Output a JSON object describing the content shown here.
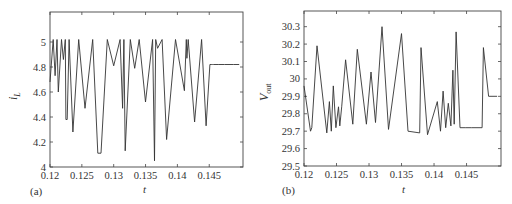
{
  "chart_data": [
    {
      "type": "line",
      "panel": "(a)",
      "title": "",
      "xlabel": "t",
      "ylabel": "i_L",
      "xlim": [
        0.12,
        0.1503
      ],
      "ylim": [
        4,
        5.24
      ],
      "xticks": [
        0.12,
        0.125,
        0.13,
        0.135,
        0.14,
        0.145
      ],
      "xtick_labels": [
        "0.12",
        "0.125",
        "0.13",
        "0.135",
        "0.14",
        "0.145"
      ],
      "yticks": [
        4,
        4.2,
        4.4,
        4.6,
        4.8,
        5
      ],
      "ytick_labels": [
        "4",
        "4.2",
        "4.4",
        "4.6",
        "4.8",
        "5"
      ],
      "grid": false,
      "legend": null,
      "series": [
        {
          "name": "i_L",
          "x": [
            0.12,
            0.1205,
            0.1208,
            0.1211,
            0.1213,
            0.1218,
            0.1221,
            0.1224,
            0.1225,
            0.1227,
            0.123,
            0.1236,
            0.1245,
            0.1255,
            0.1267,
            0.1275,
            0.128,
            0.129,
            0.13,
            0.131,
            0.1314,
            0.1316,
            0.1318,
            0.1326,
            0.1333,
            0.134,
            0.135,
            0.1361,
            0.1364,
            0.1366,
            0.1369,
            0.1376,
            0.1383,
            0.1397,
            0.1411,
            0.1414,
            0.1415,
            0.1417,
            0.1427,
            0.1438,
            0.1445,
            0.1451,
            0.1454,
            0.1455,
            0.1457,
            0.1464,
            0.1474,
            0.1481,
            0.1488,
            0.1497
          ],
          "y": [
            4.68,
            5.02,
            4.73,
            5.02,
            4.6,
            5.02,
            4.86,
            5.02,
            4.38,
            4.38,
            5.02,
            4.28,
            5.02,
            4.47,
            5.02,
            4.11,
            4.11,
            5.02,
            4.81,
            5.02,
            4.47,
            5.02,
            4.13,
            5.02,
            4.79,
            5.02,
            4.52,
            5.02,
            4.05,
            5.02,
            4.95,
            5.02,
            4.22,
            5.02,
            4.61,
            5.02,
            4.87,
            5.02,
            4.36,
            5.02,
            4.33,
            4.82,
            4.82,
            4.82,
            4.82,
            4.82,
            4.82,
            4.82,
            4.82,
            4.82
          ]
        }
      ]
    },
    {
      "type": "line",
      "panel": "(b)",
      "title": "",
      "xlabel": "t",
      "ylabel": "V_out",
      "xlim": [
        0.12,
        0.1503
      ],
      "ylim": [
        29.5,
        30.39
      ],
      "xticks": [
        0.12,
        0.125,
        0.13,
        0.135,
        0.14,
        0.145
      ],
      "xtick_labels": [
        "0.12",
        "0.125",
        "0.13",
        "0.135",
        "0.14",
        "0.145"
      ],
      "yticks": [
        29.5,
        29.6,
        29.7,
        29.8,
        29.9,
        30,
        30.1,
        30.2,
        30.3
      ],
      "ytick_labels": [
        "29.5",
        "29.6",
        "29.7",
        "29.8",
        "29.9",
        "30",
        "30.1",
        "30.2",
        "30.3"
      ],
      "grid": false,
      "legend": null,
      "series": [
        {
          "name": "V_out",
          "x": [
            0.12,
            0.121,
            0.1212,
            0.122,
            0.1235,
            0.1239,
            0.1242,
            0.1245,
            0.1249,
            0.1253,
            0.1255,
            0.1258,
            0.1264,
            0.1275,
            0.1282,
            0.1296,
            0.1303,
            0.131,
            0.132,
            0.133,
            0.135,
            0.136,
            0.1378,
            0.138,
            0.139,
            0.1405,
            0.141,
            0.1414,
            0.1418,
            0.1422,
            0.1426,
            0.1429,
            0.1431,
            0.1434,
            0.144,
            0.1448,
            0.1458,
            0.1474,
            0.1476,
            0.1484,
            0.1497
          ],
          "y": [
            29.96,
            29.7,
            29.72,
            30.19,
            29.69,
            29.87,
            29.7,
            29.96,
            29.72,
            29.84,
            29.73,
            29.84,
            30.11,
            29.74,
            30.17,
            29.74,
            30.04,
            29.75,
            30.3,
            29.71,
            30.26,
            29.7,
            29.69,
            30.18,
            29.68,
            29.87,
            29.7,
            29.93,
            29.72,
            29.86,
            29.73,
            30.05,
            29.74,
            30.27,
            29.72,
            29.72,
            29.72,
            29.72,
            30.18,
            29.9,
            29.9
          ]
        }
      ]
    }
  ],
  "panels": {
    "a": {
      "label": "(a)",
      "xlabel": "t",
      "ylabel_main": "i",
      "ylabel_sub": "L"
    },
    "b": {
      "label": "(b)",
      "xlabel": "t",
      "ylabel_main": "V",
      "ylabel_sub": "out"
    }
  }
}
